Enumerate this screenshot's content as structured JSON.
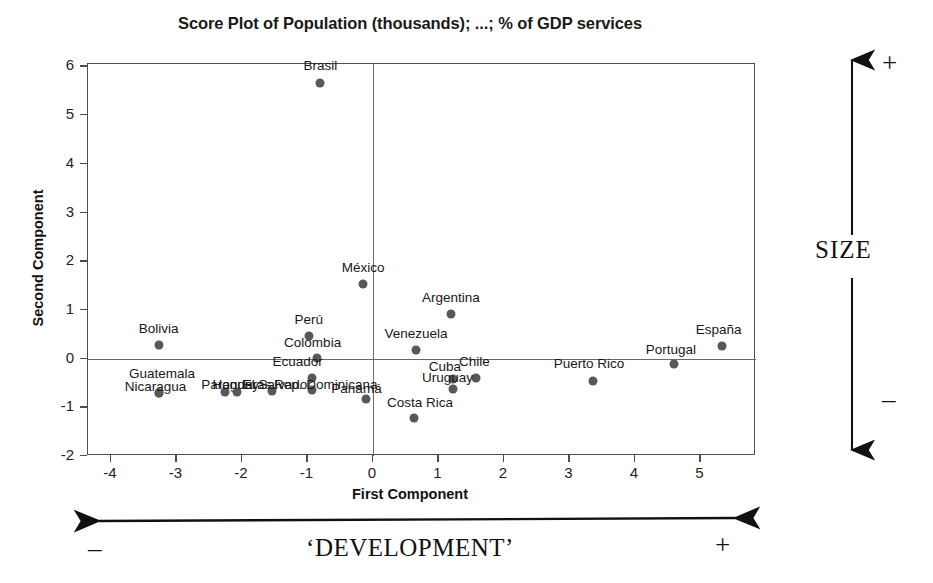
{
  "chart_data": {
    "type": "scatter",
    "title": "Score Plot of Population (thousands); ...; % of GDP services",
    "xlabel": "First Component",
    "ylabel": "Second Component",
    "xlim": [
      -4.35,
      5.85
    ],
    "ylim": [
      -2.0,
      6.05
    ],
    "xticks": [
      -4,
      -3,
      -2,
      -1,
      0,
      1,
      2,
      3,
      4,
      5
    ],
    "yticks": [
      -2,
      -1,
      0,
      1,
      2,
      3,
      4,
      5,
      6
    ],
    "xticklabels": [
      "-4",
      "-3",
      "-2",
      "-1",
      "0",
      "1",
      "2",
      "3",
      "4",
      "5"
    ],
    "yticklabels": [
      "-2",
      "-1",
      "0",
      "1",
      "2",
      "3",
      "4",
      "5",
      "6"
    ],
    "grid": false,
    "legend": null,
    "origin_lines": true,
    "marker_color": "#585858",
    "points": [
      {
        "label": "Brasil",
        "x": -0.8,
        "y": 5.67,
        "lx": -0.8,
        "ly": 6.0,
        "anchor": "middle"
      },
      {
        "label": "México",
        "x": -0.15,
        "y": 1.54,
        "lx": -0.15,
        "ly": 1.87,
        "anchor": "middle"
      },
      {
        "label": "Argentina",
        "x": 1.19,
        "y": 0.92,
        "lx": 1.19,
        "ly": 1.25,
        "anchor": "middle"
      },
      {
        "label": "Venezuela",
        "x": 0.66,
        "y": 0.17,
        "lx": 0.66,
        "ly": 0.5,
        "anchor": "middle"
      },
      {
        "label": "Perú",
        "x": -0.98,
        "y": 0.47,
        "lx": -0.98,
        "ly": 0.8,
        "anchor": "middle"
      },
      {
        "label": "Colombia",
        "x": -0.85,
        "y": 0.02,
        "lx": -0.92,
        "ly": 0.33,
        "anchor": "middle"
      },
      {
        "label": "Ecuador",
        "x": -0.93,
        "y": -0.39,
        "lx": -1.15,
        "ly": -0.06,
        "anchor": "middle"
      },
      {
        "label": "Bolivia",
        "x": -3.27,
        "y": 0.27,
        "lx": -3.27,
        "ly": 0.6,
        "anchor": "middle"
      },
      {
        "label": "Guatemala",
        "x": -3.27,
        "y": -0.7,
        "lx": -3.22,
        "ly": -0.31,
        "anchor": "middle"
      },
      {
        "label": "Nicaragua",
        "x": -3.27,
        "y": -0.7,
        "lx": -3.32,
        "ly": -0.58,
        "anchor": "middle"
      },
      {
        "label": "Paraguay",
        "x": -2.26,
        "y": -0.68,
        "lx": -2.18,
        "ly": -0.55,
        "anchor": "middle"
      },
      {
        "label": "Honduras",
        "x": -2.08,
        "y": -0.68,
        "lx": -2.0,
        "ly": -0.55,
        "anchor": "middle"
      },
      {
        "label": "El Salvador",
        "x": -1.54,
        "y": -0.66,
        "lx": -1.46,
        "ly": -0.55,
        "anchor": "middle"
      },
      {
        "label": "Rep. Dominicana",
        "x": -0.93,
        "y": -0.64,
        "lx": -0.72,
        "ly": -0.55,
        "anchor": "middle"
      },
      {
        "label": "Cuba",
        "x": 1.22,
        "y": -0.42,
        "lx": 1.1,
        "ly": -0.18,
        "anchor": "middle"
      },
      {
        "label": "Chile",
        "x": 1.58,
        "y": -0.39,
        "lx": 1.55,
        "ly": -0.06,
        "anchor": "middle"
      },
      {
        "label": "Uruguay",
        "x": 1.22,
        "y": -0.62,
        "lx": 1.14,
        "ly": -0.4,
        "anchor": "middle"
      },
      {
        "label": "Panamá",
        "x": -0.1,
        "y": -0.82,
        "lx": -0.25,
        "ly": -0.63,
        "anchor": "middle"
      },
      {
        "label": "Costa Rica",
        "x": 0.63,
        "y": -1.22,
        "lx": 0.72,
        "ly": -0.92,
        "anchor": "middle"
      },
      {
        "label": "Puerto Rico",
        "x": 3.36,
        "y": -0.45,
        "lx": 3.3,
        "ly": -0.12,
        "anchor": "middle"
      },
      {
        "label": "Portugal",
        "x": 4.6,
        "y": -0.12,
        "lx": 4.55,
        "ly": 0.18,
        "anchor": "middle"
      },
      {
        "label": "España",
        "x": 5.33,
        "y": 0.26,
        "lx": 5.28,
        "ly": 0.58,
        "anchor": "middle"
      }
    ]
  },
  "annotations": {
    "size_axis": {
      "label": "SIZE",
      "plus": "+",
      "minus": "–"
    },
    "development_axis": {
      "label": "‘DEVELOPMENT’",
      "plus": "+",
      "minus": "–"
    }
  }
}
